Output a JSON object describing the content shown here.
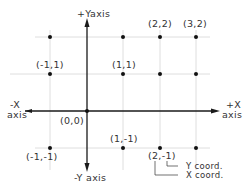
{
  "diagram": {
    "axes": {
      "pos_y_label": "+Yaxis",
      "neg_y_label": "-Y axis",
      "pos_x_label_1": "+X",
      "pos_x_label_2": "axis",
      "neg_x_label_1": "-X",
      "neg_x_label_2": "axis",
      "origin_label": "(0,0)"
    },
    "points": [
      {
        "x": -1,
        "y": 2,
        "label": ""
      },
      {
        "x": 1,
        "y": 2,
        "label": ""
      },
      {
        "x": 2,
        "y": 2,
        "label": "(2,2)"
      },
      {
        "x": 3,
        "y": 2,
        "label": "(3,2)"
      },
      {
        "x": -1,
        "y": 1,
        "label": "(-1,1)"
      },
      {
        "x": 1,
        "y": 1,
        "label": "(1,1)"
      },
      {
        "x": 2,
        "y": 1,
        "label": ""
      },
      {
        "x": 3,
        "y": 1,
        "label": ""
      },
      {
        "x": 0,
        "y": 0,
        "label": "(0,0)"
      },
      {
        "x": -1,
        "y": -1,
        "label": "(-1,-1)"
      },
      {
        "x": 1,
        "y": -1,
        "label": "(1,-1)"
      },
      {
        "x": 2,
        "y": -1,
        "label": "(2,-1)"
      },
      {
        "x": 3,
        "y": -1,
        "label": ""
      }
    ],
    "labels": {
      "p_2_2": "(2,2)",
      "p_3_2": "(3,2)",
      "p_m1_1": "(-1,1)",
      "p_1_1": "(1,1)",
      "p_1_m1": "(1,-1)",
      "p_m1_m1": "(-1,-1)",
      "p_2_m1": "(2,-1)"
    },
    "annotations": {
      "y_coord": "Y coord.",
      "x_coord": "X coord."
    },
    "colors": {
      "axis": "#1a1a1a",
      "grid": "#d6d6d6",
      "text": "#333333",
      "background": "#ffffff"
    }
  }
}
